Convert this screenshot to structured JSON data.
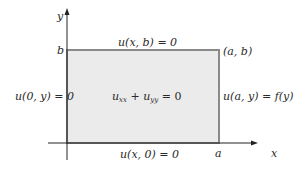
{
  "diagram": {
    "type": "dirichlet-rectangle",
    "axes": {
      "x_label": "x",
      "y_label": "y"
    },
    "corner_labels": {
      "b": "b",
      "a": "a",
      "ab": "(a, b)"
    },
    "boundary_conditions": {
      "top": "u(x, b) = 0",
      "left": "u(0, y) = 0",
      "bottom": "u(x, 0) = 0",
      "right": "u(a, y) = f(y)"
    },
    "equation": {
      "u1": "u",
      "s1": "xx",
      "plus": " + ",
      "u2": "u",
      "s2": "yy",
      "eq": " = 0"
    },
    "colors": {
      "region_fill": "#ebebeb",
      "region_border": "#8a8a8a",
      "axis": "#222222"
    }
  }
}
